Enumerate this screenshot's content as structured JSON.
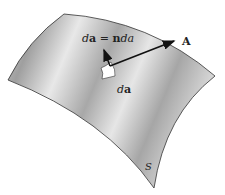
{
  "figure": {
    "labels": {
      "area_equation_da": "d",
      "area_equation_a": "a",
      "area_equation_eq": " = ",
      "area_equation_n": "n",
      "area_equation_d2": "d",
      "area_equation_a2": "a",
      "vector": "A",
      "element_d": "d",
      "element_a": "a",
      "surface": "S"
    },
    "colors": {
      "surface_light": "#e6e6e6",
      "surface_dark": "#a9a9a9",
      "outline": "#333333",
      "arrow": "#111111",
      "patch": "#ffffff"
    }
  }
}
